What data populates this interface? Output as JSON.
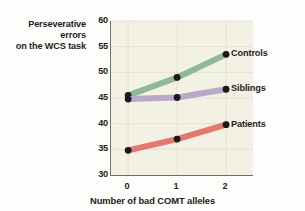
{
  "chart_data": {
    "type": "line",
    "title": "",
    "xlabel": "Number of bad COMT alleles",
    "ylabel": "Perseverative errors on the WCS task",
    "ylabel_line1": "Perseverative errors",
    "ylabel_line2": "on the WCS task",
    "x": [
      0,
      1,
      2
    ],
    "xticklabels": [
      "0",
      "1",
      "2"
    ],
    "yticklabels": [
      "60",
      "55",
      "50",
      "45",
      "40",
      "35",
      "30"
    ],
    "yticks": [
      60,
      55,
      50,
      45,
      40,
      35,
      30
    ],
    "xlim": [
      -0.35,
      2.55
    ],
    "ylim": [
      30,
      60
    ],
    "grid": true,
    "legend_position": "right-of-line-ends",
    "series": [
      {
        "name": "Controls",
        "color": "#8fb79a",
        "values": [
          45.5,
          49.0,
          53.5
        ]
      },
      {
        "name": "Siblings",
        "color": "#b9a9c6",
        "values": [
          44.8,
          45.1,
          46.7
        ]
      },
      {
        "name": "Patients",
        "color": "#e2786e",
        "values": [
          34.8,
          37.0,
          39.8
        ]
      }
    ],
    "marker_color": "#1a1a1a",
    "plot_background": "#f2f1e4",
    "axis_color": "#6f6f66",
    "gridline_color": "#e3e2d2",
    "text_color": "#231f20"
  }
}
